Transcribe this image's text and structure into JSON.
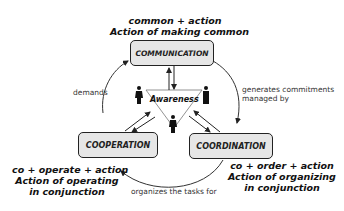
{
  "nodes": {
    "communication": {
      "label": "COMMUNICATION",
      "formula": "common + action",
      "meaning": "Action of making common"
    },
    "cooperation": {
      "label": "COOPERATION",
      "formula": "co + operate + action",
      "meaning_line1": "Action of operating",
      "meaning_line2": "in conjunction"
    },
    "coordination": {
      "label": "COORDINATION",
      "formula": "co + order + action",
      "meaning_line1": "Action of organizing",
      "meaning_line2": "in conjunction"
    },
    "awareness": {
      "label": "Awareness"
    }
  },
  "edges": {
    "demands": "demands",
    "generates_line1": "generates commitments",
    "generates_line2": "managed by",
    "organizes": "organizes the tasks for"
  }
}
